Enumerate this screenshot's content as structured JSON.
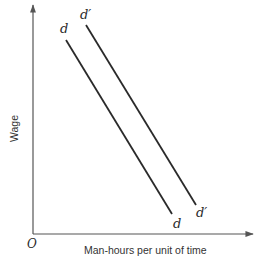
{
  "diagram": {
    "type": "labor-demand-shift",
    "axes": {
      "y_label": "Wage",
      "x_label": "Man-hours per unit of time",
      "origin_label": "O"
    },
    "curves": [
      {
        "id": "d",
        "label_top": "d",
        "label_bottom": "d",
        "start": [
          66,
          40
        ],
        "end": [
          172,
          214
        ]
      },
      {
        "id": "d_prime",
        "label_top": "d′",
        "label_bottom": "d′",
        "start": [
          86,
          25
        ],
        "end": [
          196,
          205
        ]
      }
    ],
    "colors": {
      "line": "#2a2a2a",
      "axis": "#555555",
      "background": "#ffffff"
    }
  }
}
